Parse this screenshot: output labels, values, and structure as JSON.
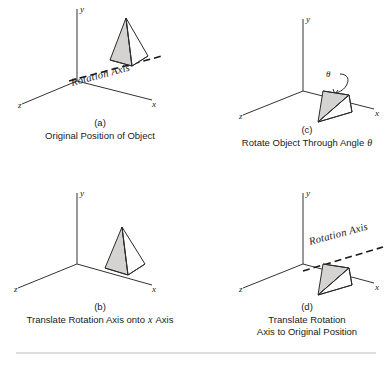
{
  "figure": {
    "axis_labels": {
      "x": "x",
      "y": "y",
      "z": "z"
    },
    "rotation_axis_label": "Rotation Axis",
    "theta_symbol": "θ",
    "panels": [
      {
        "id": "a",
        "letter": "(a)",
        "caption": "Original Position  of Object",
        "caption_line2": "",
        "has_rotation_axis": true,
        "has_theta": false
      },
      {
        "id": "c",
        "letter": "(c)",
        "caption": "Rotate Object Through Angle",
        "caption_suffix_italic": "θ",
        "caption_line2": "",
        "has_rotation_axis": false,
        "has_theta": true
      },
      {
        "id": "b",
        "letter": "(b)",
        "caption_pre": "Translate Rotation Axis onto",
        "caption_italic": "x",
        "caption_post": "Axis",
        "caption_line2": "",
        "has_rotation_axis": false,
        "has_theta": false
      },
      {
        "id": "d",
        "letter": "(d)",
        "caption": "Translate Rotation",
        "caption_line2": "Axis to Original Position",
        "has_rotation_axis": true,
        "has_theta": false
      }
    ]
  }
}
